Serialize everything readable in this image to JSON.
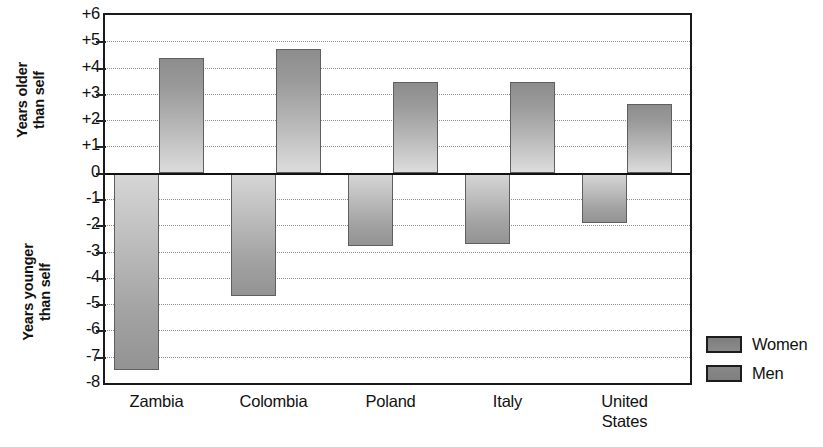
{
  "chart_data": {
    "type": "bar",
    "title": "",
    "subtitle": "",
    "xlabel": "",
    "ylabel_upper": "Years older\nthan self",
    "ylabel_lower": "Years younger\nthan self",
    "categories": [
      "Zambia",
      "Colombia",
      "Poland",
      "Italy",
      "United\nStates"
    ],
    "series": [
      {
        "name": "Women",
        "values": [
          4.35,
          4.7,
          3.45,
          3.45,
          2.6
        ]
      },
      {
        "name": "Men",
        "values": [
          -7.5,
          -4.7,
          -2.8,
          -2.7,
          -1.9
        ]
      }
    ],
    "ylim": [
      -8,
      6
    ],
    "ytick_labels": [
      "+6",
      "+5",
      "+4",
      "+3",
      "+2",
      "+1",
      "0",
      "-1",
      "-2",
      "-3",
      "-4",
      "-5",
      "-6",
      "-7",
      "-8"
    ],
    "ytick_values": [
      6,
      5,
      4,
      3,
      2,
      1,
      0,
      -1,
      -2,
      -3,
      -4,
      -5,
      -6,
      -7,
      -8
    ],
    "grid": true,
    "legend_position": "right-bottom",
    "colors": {
      "women": "#8d8d8d",
      "men": "#b5b5b5",
      "axis": "#1a1a1a",
      "grid": "#8d8d8d",
      "text": "#111111"
    }
  }
}
